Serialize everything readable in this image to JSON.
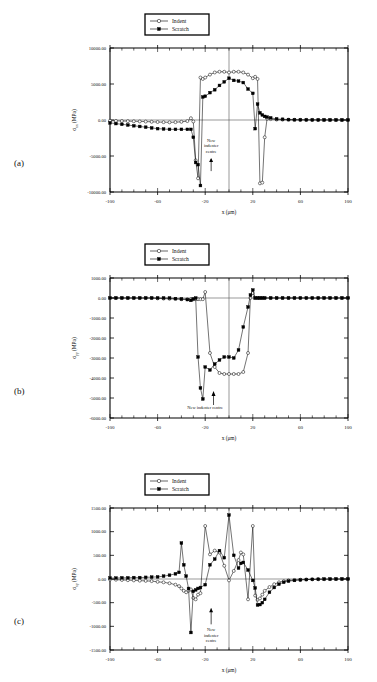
{
  "figure": {
    "panel_labels": [
      "(a)",
      "(b)",
      "(c)"
    ],
    "legend": {
      "indent_label": "Indent",
      "scratch_label": "Scratch"
    },
    "annotation_lines_stacked": [
      "New",
      "indenter",
      "centre"
    ],
    "annotation_single": "New indenter centre",
    "xlabel_main": "x",
    "xlabel_unit": "(μm)",
    "ylabel_unit": "(MPa)"
  },
  "chart_data": [
    {
      "type": "line",
      "panel": "(a)",
      "title": "",
      "xlabel": "x (μm)",
      "ylabel": "σxx (MPa)",
      "ylabel_sym": "σ",
      "ylabel_sub": "xx",
      "xlim": [
        -100,
        100
      ],
      "ylim": [
        -10000,
        10000
      ],
      "xticks": [
        -100,
        -60,
        -20,
        20,
        60,
        100
      ],
      "xtick_labels": [
        "-100",
        "-60",
        "-20",
        "20",
        "60",
        "100"
      ],
      "yticks": [
        10000,
        5000,
        0,
        -5000,
        -10000
      ],
      "ytick_labels": [
        "10000.00",
        "5000.00",
        "0.00",
        "-5000.00",
        "-10000.00"
      ],
      "xtick_step_minor": 10,
      "grid": false,
      "legend_position": "top-center",
      "annotation": {
        "text": "New indenter centre",
        "x": -15,
        "arrow": "up",
        "style": "stacked"
      },
      "vertical_marker_x": 0,
      "series": [
        {
          "name": "Indent",
          "marker": "open-circle",
          "x": [
            -100,
            -95,
            -90,
            -85,
            -80,
            -75,
            -70,
            -65,
            -60,
            -55,
            -50,
            -45,
            -40,
            -35,
            -32,
            -30,
            -28,
            -26,
            -24,
            -22,
            -20,
            -16,
            -12,
            -8,
            -4,
            0,
            4,
            8,
            12,
            16,
            20,
            22,
            24,
            26,
            28,
            30,
            32,
            35,
            40,
            45,
            50,
            55,
            60,
            65,
            70,
            75,
            80,
            85,
            90,
            95,
            100
          ],
          "y": [
            -100,
            -120,
            -140,
            -160,
            -180,
            -200,
            -220,
            -250,
            -280,
            -300,
            -320,
            -300,
            -250,
            -150,
            250,
            -200,
            -5600,
            -8100,
            5900,
            5700,
            5900,
            6300,
            6600,
            6700,
            6700,
            6600,
            6700,
            6700,
            6600,
            6300,
            5800,
            6000,
            5700,
            -8800,
            -8700,
            -2400,
            200,
            120,
            60,
            40,
            30,
            25,
            20,
            15,
            12,
            10,
            8,
            6,
            4,
            2,
            0
          ]
        },
        {
          "name": "Scratch",
          "marker": "filled-square",
          "x": [
            -100,
            -95,
            -90,
            -85,
            -80,
            -75,
            -70,
            -65,
            -60,
            -55,
            -50,
            -45,
            -40,
            -35,
            -32,
            -30,
            -28,
            -26,
            -24,
            -22,
            -20,
            -16,
            -12,
            -8,
            -4,
            0,
            4,
            8,
            12,
            16,
            20,
            22,
            24,
            26,
            28,
            30,
            32,
            35,
            40,
            45,
            50,
            55,
            60,
            65,
            70,
            75,
            80,
            85,
            90,
            95,
            100
          ],
          "y": [
            -400,
            -500,
            -600,
            -700,
            -800,
            -900,
            -1000,
            -1100,
            -1200,
            -1250,
            -1300,
            -1300,
            -1300,
            -1300,
            -1300,
            -2400,
            -5900,
            -6200,
            -9100,
            3200,
            3300,
            3800,
            4200,
            4800,
            5300,
            5800,
            5500,
            5400,
            5200,
            4300,
            3700,
            -1200,
            2200,
            1000,
            700,
            500,
            400,
            300,
            150,
            100,
            60,
            40,
            30,
            20,
            15,
            10,
            8,
            6,
            4,
            2,
            0
          ]
        }
      ]
    },
    {
      "type": "line",
      "panel": "(b)",
      "title": "",
      "xlabel": "x (μm)",
      "ylabel": "σyy (MPa)",
      "ylabel_sym": "σ",
      "ylabel_sub": "yy",
      "xlim": [
        -100,
        100
      ],
      "ylim": [
        -6000,
        1000
      ],
      "xticks": [
        -100,
        -60,
        -20,
        20,
        60,
        100
      ],
      "xtick_labels": [
        "-100",
        "-60",
        "-20",
        "20",
        "60",
        "100"
      ],
      "yticks": [
        1000,
        0,
        -1000,
        -2000,
        -3000,
        -4000,
        -5000,
        -6000
      ],
      "ytick_labels": [
        "1000.00",
        "0.00",
        "-1000.00",
        "-2000.00",
        "-3000.00",
        "-4000.00",
        "-5000.00",
        "-6000.00"
      ],
      "xtick_step_minor": 10,
      "grid": false,
      "legend_position": "top-center",
      "annotation": {
        "text": "New indenter centre",
        "x": -15,
        "arrow": "up",
        "style": "single"
      },
      "vertical_marker_x": 0,
      "series": [
        {
          "name": "Indent",
          "marker": "open-circle",
          "x": [
            -100,
            -95,
            -90,
            -85,
            -80,
            -75,
            -70,
            -65,
            -60,
            -55,
            -50,
            -45,
            -40,
            -35,
            -32,
            -30,
            -28,
            -26,
            -24,
            -22,
            -20,
            -16,
            -12,
            -8,
            -4,
            0,
            4,
            8,
            12,
            16,
            18,
            20,
            22,
            24,
            26,
            28,
            30,
            35,
            40,
            45,
            50,
            55,
            60,
            65,
            70,
            75,
            80,
            85,
            90,
            95,
            100
          ],
          "y": [
            0,
            0,
            0,
            0,
            0,
            0,
            0,
            0,
            -20,
            -30,
            -40,
            -50,
            -60,
            -60,
            -60,
            -60,
            -60,
            -60,
            -60,
            -60,
            300,
            -2750,
            -3450,
            -3750,
            -3800,
            -3800,
            -3800,
            -3800,
            -3700,
            -2750,
            0,
            250,
            0,
            0,
            0,
            0,
            0,
            0,
            0,
            0,
            0,
            0,
            0,
            0,
            0,
            0,
            0,
            0,
            0,
            0,
            0
          ]
        },
        {
          "name": "Scratch",
          "marker": "filled-square",
          "x": [
            -100,
            -95,
            -90,
            -85,
            -80,
            -75,
            -70,
            -65,
            -60,
            -55,
            -50,
            -45,
            -40,
            -35,
            -32,
            -30,
            -28,
            -26,
            -24,
            -22,
            -20,
            -16,
            -12,
            -8,
            -4,
            0,
            4,
            8,
            12,
            16,
            18,
            20,
            22,
            24,
            26,
            28,
            30,
            35,
            40,
            45,
            50,
            55,
            60,
            65,
            70,
            75,
            80,
            85,
            90,
            95,
            100
          ],
          "y": [
            0,
            0,
            0,
            0,
            0,
            0,
            0,
            0,
            0,
            0,
            0,
            -30,
            -50,
            -80,
            -120,
            -50,
            0,
            -2950,
            -4500,
            -5050,
            -3450,
            -3600,
            -3300,
            -3100,
            -2950,
            -2950,
            -3000,
            -2600,
            -1450,
            -450,
            150,
            400,
            0,
            0,
            0,
            0,
            0,
            0,
            0,
            0,
            0,
            0,
            0,
            0,
            0,
            0,
            0,
            0,
            0,
            0,
            0
          ]
        }
      ]
    },
    {
      "type": "line",
      "panel": "(c)",
      "title": "",
      "xlabel": "x (μm)",
      "ylabel": "σxy (MPa)",
      "ylabel_sym": "σ",
      "ylabel_sub": "xy",
      "xlim": [
        -100,
        100
      ],
      "ylim": [
        -1500,
        1500
      ],
      "xticks": [
        -100,
        -60,
        -20,
        20,
        60,
        100
      ],
      "xtick_labels": [
        "-100",
        "-60",
        "-20",
        "20",
        "60",
        "100"
      ],
      "yticks": [
        1500,
        1000,
        500,
        0,
        -500,
        -1000,
        -1500
      ],
      "ytick_labels": [
        "1500.00",
        "1000.00",
        "500.00",
        "0.00",
        "-500.00",
        "-1000.00",
        "-1500.00"
      ],
      "xtick_step_minor": 10,
      "grid": false,
      "legend_position": "top-center",
      "annotation": {
        "text": "New indenter centre",
        "x": -15,
        "arrow": "up",
        "style": "stacked-below"
      },
      "vertical_marker_x": 0,
      "series": [
        {
          "name": "Indent",
          "marker": "open-circle",
          "x": [
            -100,
            -95,
            -90,
            -85,
            -80,
            -75,
            -70,
            -65,
            -60,
            -55,
            -50,
            -45,
            -42,
            -40,
            -38,
            -36,
            -34,
            -32,
            -30,
            -28,
            -26,
            -24,
            -20,
            -16,
            -12,
            -8,
            -4,
            0,
            4,
            8,
            10,
            12,
            16,
            20,
            22,
            24,
            26,
            28,
            30,
            34,
            38,
            42,
            46,
            50,
            55,
            60,
            65,
            70,
            75,
            80,
            85,
            90,
            95,
            100
          ],
          "y": [
            -10,
            -15,
            -20,
            -25,
            -30,
            -35,
            -40,
            -45,
            -60,
            -70,
            -90,
            -120,
            -150,
            -200,
            -250,
            -280,
            -250,
            -220,
            -400,
            -430,
            -330,
            -300,
            1120,
            520,
            600,
            560,
            280,
            -30,
            170,
            400,
            560,
            520,
            -430,
            1120,
            -350,
            -440,
            -410,
            -330,
            -250,
            -170,
            -110,
            -70,
            -45,
            -30,
            -20,
            -15,
            -10,
            -8,
            -6,
            -4,
            -3,
            -2,
            -1,
            0
          ]
        },
        {
          "name": "Scratch",
          "marker": "filled-square",
          "x": [
            -100,
            -95,
            -90,
            -85,
            -80,
            -75,
            -70,
            -65,
            -60,
            -55,
            -50,
            -45,
            -42,
            -40,
            -38,
            -36,
            -34,
            -32,
            -30,
            -28,
            -26,
            -24,
            -20,
            -16,
            -12,
            -8,
            -4,
            0,
            4,
            8,
            10,
            12,
            16,
            20,
            22,
            24,
            26,
            28,
            30,
            34,
            38,
            42,
            46,
            50,
            55,
            60,
            65,
            70,
            75,
            80,
            85,
            90,
            95,
            100
          ],
          "y": [
            20,
            20,
            25,
            25,
            30,
            30,
            35,
            40,
            45,
            60,
            80,
            110,
            140,
            760,
            300,
            60,
            -200,
            -1130,
            -260,
            -230,
            -200,
            -180,
            -120,
            300,
            420,
            600,
            450,
            1350,
            500,
            230,
            330,
            350,
            190,
            -30,
            -190,
            -550,
            -540,
            -500,
            -430,
            -280,
            -180,
            -110,
            -70,
            -45,
            -30,
            -20,
            -12,
            -8,
            -5,
            -3,
            -2,
            -1,
            0,
            0
          ]
        }
      ]
    }
  ]
}
